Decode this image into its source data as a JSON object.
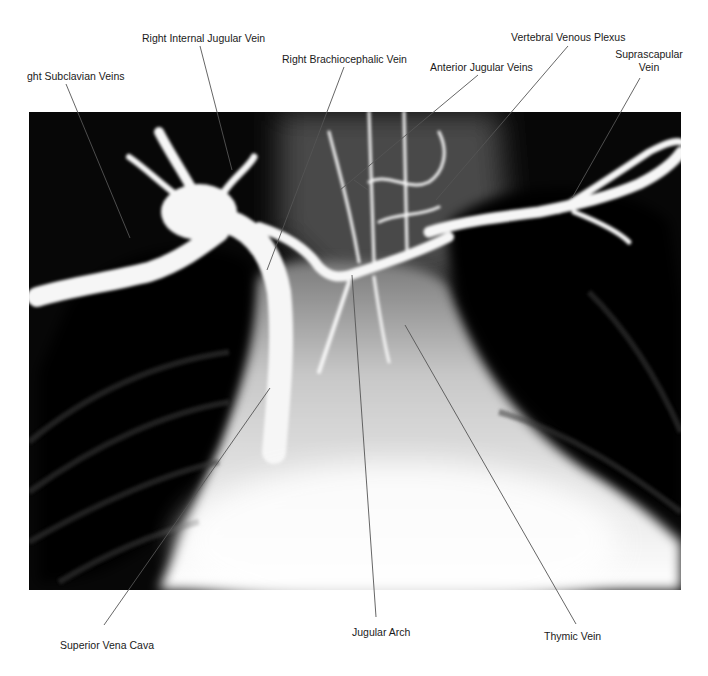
{
  "figure": {
    "type": "annotated radiograph (venogram)",
    "labels": {
      "right_subclavian_veins": "ght Subclavian Veins",
      "right_internal_jugular_vein": "Right Internal Jugular Vein",
      "right_brachiocephalic_vein": "Right Brachiocephalic Vein",
      "anterior_jugular_veins": "Anterior Jugular Veins",
      "vertebral_venous_plexus": "Vertebral Venous Plexus",
      "suprascapular_vein_line1": "Suprascapular",
      "suprascapular_vein_line2": "Vein",
      "superior_vena_cava": "Superior Vena Cava",
      "jugular_arch": "Jugular Arch",
      "thymic_vein": "Thymic Vein"
    },
    "colors": {
      "background": "#ffffff",
      "film_dark": "#050505",
      "vessel_bright": "#f4f4f4",
      "leader_line": "#555555",
      "label_text": "#1a1a1a"
    }
  }
}
